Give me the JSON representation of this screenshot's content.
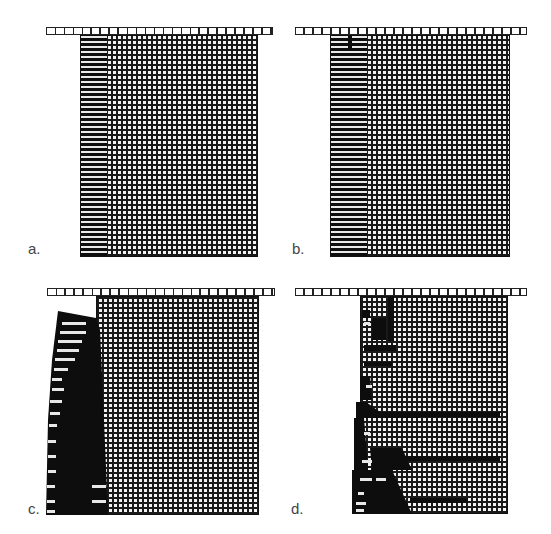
{
  "figure": {
    "panels": [
      {
        "id": "a",
        "label": "a.",
        "description": "Initial stage: intact block under top platen, thin fractured zone along left face"
      },
      {
        "id": "b",
        "label": "b.",
        "description": "Fractured zone along left face widens slightly"
      },
      {
        "id": "c",
        "label": "c.",
        "description": "Left slab detaches and buckles outward; crushed dark zone"
      },
      {
        "id": "d",
        "label": "d.",
        "description": "Progressive slabbing with horizontal cracks propagating into block"
      }
    ],
    "colors": {
      "mesh": "#1a1a1a",
      "failed": "#0d0d0d",
      "background": "#ffffff"
    }
  }
}
